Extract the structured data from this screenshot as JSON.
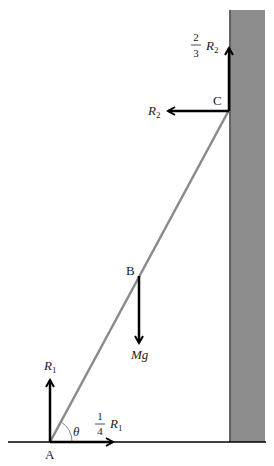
{
  "diagram": {
    "type": "ladder-against-wall free-body diagram",
    "colors": {
      "wall": "#8c8c8c",
      "wall_edge": "#555555",
      "ladder": "#8a8a8a",
      "arrows": "#000000",
      "ground": "#000000",
      "text": "#222222"
    },
    "points": {
      "A": {
        "label": "A",
        "x": 50,
        "y": 442
      },
      "B": {
        "label": "B",
        "x": 139,
        "y": 276
      },
      "C": {
        "label": "C",
        "x": 229,
        "y": 110
      }
    },
    "angle": {
      "label": "θ"
    },
    "forces": {
      "R1": {
        "label": "R",
        "sub": "1",
        "direction": "up",
        "at": "A"
      },
      "friction_A": {
        "coef_num": "1",
        "coef_den": "4",
        "label": "R",
        "sub": "1",
        "direction": "right",
        "at": "A"
      },
      "weight": {
        "label": "Mg",
        "direction": "down",
        "at": "B"
      },
      "R2": {
        "label": "R",
        "sub": "2",
        "direction": "left",
        "at": "C"
      },
      "friction_C": {
        "coef_num": "2",
        "coef_den": "3",
        "label": "R",
        "sub": "2",
        "direction": "up",
        "at": "C"
      }
    }
  }
}
